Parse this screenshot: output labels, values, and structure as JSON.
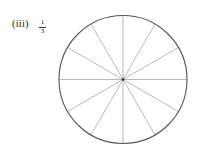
{
  "figure": {
    "label": "(iii)",
    "fraction": {
      "numerator": "1",
      "denominator": "3"
    },
    "circle": {
      "cx": 123,
      "cy": 79.5,
      "r": 64,
      "sectors": 12,
      "stroke": "#555555",
      "divider_stroke": "#a8a8a8"
    }
  }
}
